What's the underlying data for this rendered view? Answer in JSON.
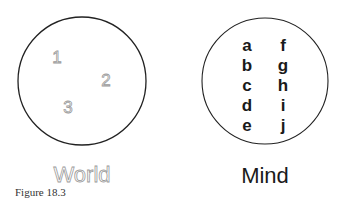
{
  "figure": {
    "caption": "Figure 18.3",
    "world": {
      "label": "World",
      "items": [
        "1",
        "2",
        "3"
      ]
    },
    "mind": {
      "label": "Mind",
      "column_left": [
        "a",
        "b",
        "c",
        "d",
        "e"
      ],
      "column_right": [
        "f",
        "g",
        "h",
        "i",
        "j"
      ]
    }
  },
  "colors": {
    "circle_stroke": "#222222",
    "outline_text": "#9a9a9a",
    "solid_text": "#1a1a1a"
  }
}
